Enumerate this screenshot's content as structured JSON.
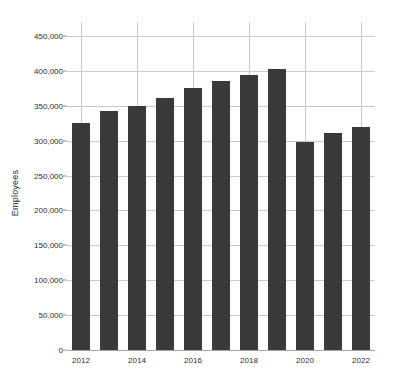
{
  "chart_data": {
    "type": "bar",
    "title": "",
    "subtitle": "",
    "xlabel": "",
    "ylabel": "Employees",
    "categories": [
      "2012",
      "2013",
      "2014",
      "2015",
      "2016",
      "2017",
      "2018",
      "2019",
      "2020",
      "2021",
      "2022"
    ],
    "values": [
      325000,
      342000,
      350000,
      361000,
      375000,
      386000,
      394000,
      403000,
      298000,
      311000,
      319000
    ],
    "series": [
      {
        "name": "Employees",
        "values": [
          325000,
          342000,
          350000,
          361000,
          375000,
          386000,
          394000,
          403000,
          298000,
          311000,
          319000
        ]
      }
    ],
    "ylim": [
      0,
      470000
    ],
    "ytick_values": [
      0,
      50000,
      100000,
      150000,
      200000,
      250000,
      300000,
      350000,
      400000,
      450000
    ],
    "ytick_labels": [
      "0",
      "50,000",
      "100,000",
      "150,000",
      "200,000",
      "250,000",
      "300,000",
      "350,000",
      "400,000",
      "450,000"
    ],
    "xtick_labels": [
      "2012",
      "2014",
      "2016",
      "2018",
      "2020",
      "2022"
    ],
    "grid": "both",
    "legend": "none",
    "bar_color": "#3a3a3a",
    "grid_color": "#c9c9c9",
    "axis_color": "#a8a8a8",
    "text_color": "#2a2a2a",
    "background_color": "#ffffff"
  }
}
